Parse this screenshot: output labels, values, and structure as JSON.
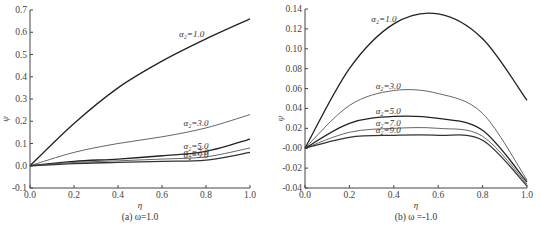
{
  "chart_data": [
    {
      "type": "line",
      "caption": "(a) ω=1.0",
      "xlabel": "η",
      "ylabel": "ψ",
      "xlim": [
        0.0,
        1.0
      ],
      "ylim": [
        -0.1,
        0.7
      ],
      "xticks": [
        "0.0",
        "0.2",
        "0.4",
        "0.6",
        "0.8",
        "1.0"
      ],
      "yticks": [
        "-0.1",
        "0.0",
        "0.1",
        "0.2",
        "0.3",
        "0.4",
        "0.5",
        "0.6",
        "0.7"
      ],
      "grid": false,
      "x": [
        0.0,
        0.2,
        0.4,
        0.6,
        0.8,
        1.0
      ],
      "series": [
        {
          "name": "α₂=1.0",
          "values": [
            0.0,
            0.19,
            0.35,
            0.47,
            0.57,
            0.66
          ]
        },
        {
          "name": "α₂=3.0",
          "values": [
            0.0,
            0.06,
            0.1,
            0.13,
            0.17,
            0.23
          ]
        },
        {
          "name": "α₂=5.0",
          "values": [
            0.0,
            0.02,
            0.03,
            0.045,
            0.065,
            0.12
          ]
        },
        {
          "name": "α₂=7.0",
          "values": [
            0.0,
            0.015,
            0.022,
            0.03,
            0.04,
            0.08
          ]
        },
        {
          "name": "α₂=9.0",
          "values": [
            0.0,
            0.01,
            0.015,
            0.02,
            0.025,
            0.06
          ]
        }
      ]
    },
    {
      "type": "line",
      "caption": "(b) ω =-1.0",
      "xlabel": "η",
      "ylabel": "ψ",
      "xlim": [
        0.0,
        1.0
      ],
      "ylim": [
        -0.04,
        0.14
      ],
      "xticks": [
        "0.0",
        "0.2",
        "0.4",
        "0.6",
        "0.8",
        "1.0"
      ],
      "yticks": [
        "-0.04",
        "-0.02",
        "-0.00",
        "0.02",
        "0.04",
        "0.06",
        "0.08",
        "0.10",
        "0.12",
        "0.14"
      ],
      "grid": false,
      "x": [
        0.0,
        0.2,
        0.4,
        0.6,
        0.8,
        1.0
      ],
      "series": [
        {
          "name": "α₂=1.0",
          "values": [
            0.0,
            0.08,
            0.125,
            0.135,
            0.11,
            0.048
          ]
        },
        {
          "name": "α₂=3.0",
          "values": [
            0.0,
            0.043,
            0.058,
            0.055,
            0.035,
            -0.032
          ]
        },
        {
          "name": "α₂=5.0",
          "values": [
            0.0,
            0.025,
            0.032,
            0.03,
            0.018,
            -0.034
          ]
        },
        {
          "name": "α₂=7.0",
          "values": [
            0.0,
            0.016,
            0.02,
            0.02,
            0.012,
            -0.036
          ]
        },
        {
          "name": "α₂=9.0",
          "values": [
            0.0,
            0.011,
            0.013,
            0.013,
            0.008,
            -0.038
          ]
        }
      ]
    }
  ]
}
